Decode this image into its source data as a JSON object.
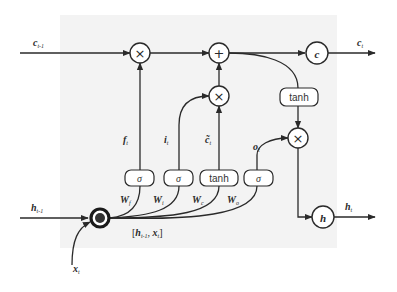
{
  "diagram": {
    "inputs": {
      "cell_prev": {
        "label": "c",
        "sub": "t-1"
      },
      "hidden_prev": {
        "label": "h",
        "sub": "t-1"
      },
      "x": {
        "label": "x",
        "sub": "t"
      }
    },
    "outputs": {
      "cell": {
        "label": "c",
        "sub": "t"
      },
      "hidden": {
        "label": "h",
        "sub": "t"
      }
    },
    "operators": {
      "forget_mult": "×",
      "input_mult": "×",
      "add": "+",
      "output_mult": "×"
    },
    "state_nodes": {
      "c_node": "c",
      "h_node": "h"
    },
    "activation_boxes": {
      "forget": "σ",
      "input": "σ",
      "candidate": "tanh",
      "output": "σ",
      "cell_tanh": "tanh"
    },
    "gate_labels": {
      "forget": {
        "label": "f",
        "sub": "t"
      },
      "input": {
        "label": "i",
        "sub": "t"
      },
      "candidate": {
        "label": "c̃",
        "sub": "t"
      },
      "output": {
        "label": "o",
        "sub": "t"
      }
    },
    "weights": {
      "forget": {
        "label": "W",
        "sub": "f"
      },
      "input": {
        "label": "W",
        "sub": "i"
      },
      "candidate": {
        "label": "W",
        "sub": "c"
      },
      "output": {
        "label": "W",
        "sub": "o"
      }
    },
    "concat": {
      "open": "[",
      "h": "h",
      "h_sub": "t-1",
      "sep": ", ",
      "x": "x",
      "x_sub": "t",
      "close": "]"
    }
  },
  "colors": {
    "panel": "#f3f3f3",
    "stroke": "#2a2a2a",
    "background": "#ffffff"
  }
}
